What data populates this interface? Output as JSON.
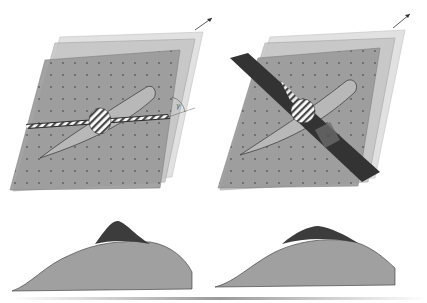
{
  "figure": {
    "type": "schematic",
    "colors": {
      "plane_light": "#d6d6d6",
      "plane_mid": "#b0b0b0",
      "plane_dark": "#8e8e8e",
      "wing": "#a8a8a8",
      "dark_band": "#3a3a3a",
      "profile_light": "#a0a0a0",
      "profile_dark": "#3c3c3c"
    },
    "panels": [
      {
        "id": "left",
        "angle_label": "γ",
        "band_style": "thin-horizontal-hatched",
        "profile_peak": "narrow-tall"
      },
      {
        "id": "right",
        "angle_label": "φ",
        "band_style": "wide-diagonal-dark",
        "profile_peak": "broad-low"
      }
    ]
  }
}
